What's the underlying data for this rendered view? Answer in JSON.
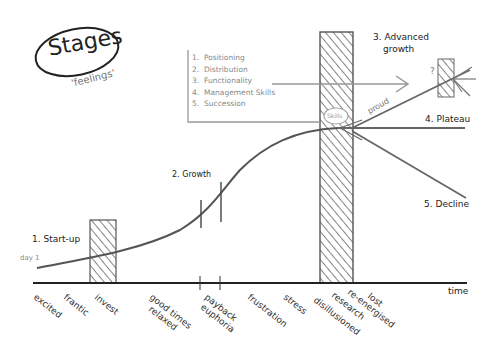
{
  "title": {
    "main": "Stages",
    "subtitle": "'feelings'"
  },
  "stages": [
    {
      "label": "1. Start-up"
    },
    {
      "label": "2. Growth"
    },
    {
      "label": "3. Advanced growth",
      "line1": "3. Advanced",
      "line2": "growth"
    },
    {
      "label": "4. Plateau"
    },
    {
      "label": "5. Decline"
    }
  ],
  "curve_start_label": "day 1",
  "skills_badge": "Skills",
  "proud_label": "proud",
  "question_mark": "?",
  "x_axis_label": "time",
  "focus_list": [
    {
      "num": "1.",
      "text": "Positioning"
    },
    {
      "num": "2.",
      "text": "Distribution"
    },
    {
      "num": "3.",
      "text": "Functionality"
    },
    {
      "num": "4.",
      "text": "Management Skills"
    },
    {
      "num": "5.",
      "text": "Succession"
    }
  ],
  "feelings": [
    {
      "text": "excited"
    },
    {
      "text": "frantic"
    },
    {
      "text": "invest"
    },
    {
      "text": "good times",
      "line2": "relaxed"
    },
    {
      "text": "payback",
      "line2": "euphoria"
    },
    {
      "text": "frustration"
    },
    {
      "text": "stress"
    },
    {
      "text": "disillusioned"
    },
    {
      "text": "research"
    },
    {
      "text": "re-energised"
    },
    {
      "text": "lost"
    }
  ],
  "colors": {
    "ink": "#2a2a2a",
    "pencil": "#777777",
    "hatch": "#666666",
    "background": "#ffffff"
  }
}
